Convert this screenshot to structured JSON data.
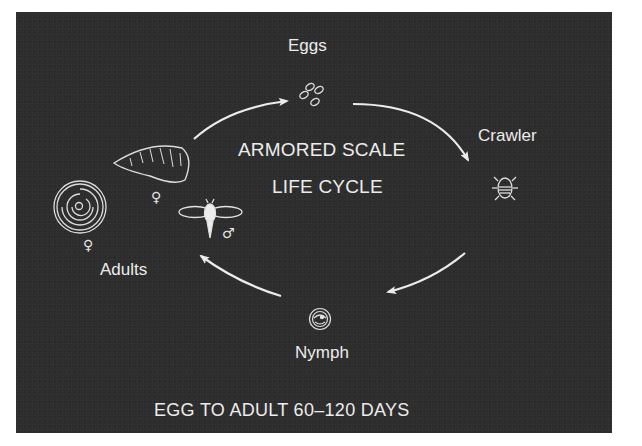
{
  "diagram": {
    "title_line1": "ARMORED SCALE",
    "title_line2": "LIFE CYCLE",
    "footer": "EGG TO ADULT 60–120 DAYS",
    "stages": [
      {
        "id": "eggs",
        "label": "Eggs",
        "icon": "eggs-icon"
      },
      {
        "id": "crawler",
        "label": "Crawler",
        "icon": "crawler-icon"
      },
      {
        "id": "nymph",
        "label": "Nymph",
        "icon": "nymph-icon"
      },
      {
        "id": "adults",
        "label": "Adults",
        "icon": "adults-icon"
      }
    ],
    "adults": {
      "female_symbol": "♀",
      "male_symbol": "♂",
      "female_scale_1": "female-round-scale-icon",
      "female_scale_2": "female-oyster-scale-icon",
      "male": "male-winged-adult-icon"
    },
    "cycle_order": [
      "Eggs",
      "Crawler",
      "Nymph",
      "Adults",
      "Eggs"
    ],
    "colors": {
      "background": "#2e2e2e",
      "foreground": "#ececec",
      "page": "#ffffff"
    }
  }
}
